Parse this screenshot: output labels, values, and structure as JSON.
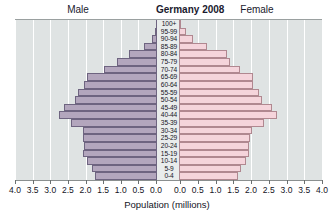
{
  "header": {
    "male_label": "Male",
    "female_label": "Female",
    "title": "Germany 2008"
  },
  "axis": {
    "x_title": "Population (millions)",
    "tick_labels_left": [
      "4.0",
      "3.5",
      "3.0",
      "2.5",
      "2.0",
      "1.5",
      "1.0",
      "0.5",
      "0.0"
    ],
    "tick_labels_right": [
      "0.0",
      "0.5",
      "1.0",
      "1.5",
      "2.0",
      "2.5",
      "3.0",
      "3.5",
      "4.0"
    ]
  },
  "chart_data": {
    "type": "bar",
    "subtype": "population-pyramid",
    "title": "Germany 2008",
    "xlabel": "Population (millions)",
    "ylabel": "",
    "xlim": [
      0,
      4.0
    ],
    "xtick_step": 0.5,
    "grid": true,
    "legend_position": "top",
    "colors": {
      "male_fill": "#b3a6bd",
      "male_stroke": "#6e6480",
      "female_fill": "#f5d4db",
      "female_stroke": "#b08890",
      "plot_background": "#dfe3e3",
      "gridline": "#ffffff",
      "age_band_background": "#e9ecec"
    },
    "categories": [
      "100+",
      "95-99",
      "90-94",
      "85-89",
      "80-84",
      "75-79",
      "70-74",
      "65-69",
      "60-64",
      "55-59",
      "50-54",
      "45-49",
      "40-44",
      "35-39",
      "30-34",
      "25-29",
      "20-24",
      "15-19",
      "10-14",
      "5-9",
      "0-4"
    ],
    "series": [
      {
        "name": "Male",
        "side": "left",
        "values": [
          0.01,
          0.04,
          0.12,
          0.33,
          0.78,
          1.1,
          1.48,
          1.95,
          2.05,
          2.2,
          2.3,
          2.62,
          2.75,
          2.42,
          2.08,
          2.06,
          2.03,
          2.06,
          1.96,
          1.82,
          1.72
        ]
      },
      {
        "name": "Female",
        "side": "right",
        "values": [
          0.04,
          0.16,
          0.38,
          0.76,
          1.33,
          1.42,
          1.7,
          2.05,
          2.07,
          2.22,
          2.32,
          2.6,
          2.74,
          2.36,
          2.02,
          1.98,
          1.93,
          1.95,
          1.86,
          1.73,
          1.63
        ]
      }
    ]
  }
}
